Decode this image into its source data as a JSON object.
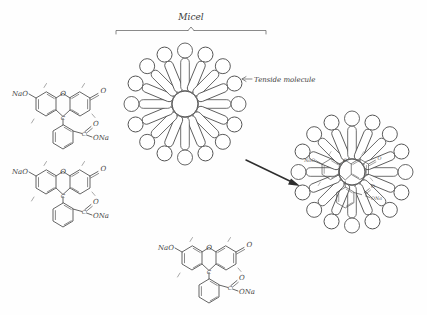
{
  "figure": {
    "kind": "hand-drawn-schematic",
    "background_color": "#fefefe",
    "ink_color": "#4a4a4a",
    "arrow_color": "#2e2e2e",
    "width": 427,
    "height": 315
  },
  "labels": {
    "micelle_title": "Micel",
    "tenside_callout": "Tenside molecule"
  },
  "molecule": {
    "name": "fluorescein disodium",
    "phenolate_label": "NaO",
    "ketone_label": "O",
    "ether_label": "O",
    "bridge_carbon_label": "C",
    "carboxyl_carbon_label": "C",
    "carbonyl_oxygen_label": "O",
    "carboxylate_label": "ONa"
  },
  "molecules_free": [
    {
      "id": "free-molecule-top-left",
      "x": 22,
      "y": 70,
      "scale": 1.0,
      "labels": {
        "NaO": "NaO",
        "O_ether": "O",
        "O_keto": "O",
        "C_bridge": "C",
        "C_acid": "C",
        "O_carbonyl": "O",
        "ONa": "ONa"
      }
    },
    {
      "id": "free-molecule-mid-left",
      "x": 22,
      "y": 148,
      "scale": 1.0,
      "labels": {
        "NaO": "NaO",
        "O_ether": "O",
        "O_keto": "O",
        "C_bridge": "C",
        "C_acid": "C",
        "O_carbonyl": "O",
        "ONa": "ONa"
      }
    },
    {
      "id": "free-molecule-bottom-center",
      "x": 168,
      "y": 224,
      "scale": 1.0,
      "labels": {
        "NaO": "NaO",
        "O_ether": "O",
        "O_keto": "O",
        "C_bridge": "C",
        "C_acid": "C",
        "O_carbonyl": "O",
        "ONa": "ONa"
      }
    }
  ],
  "micelles": [
    {
      "id": "empty-micelle",
      "role": "pure surfactant micelle (left)",
      "center_x": 185,
      "center_y": 104,
      "hub_radius": 13,
      "tail_length": 33,
      "head_radius": 7.5,
      "arm_count": 16,
      "contains_dye": false
    },
    {
      "id": "loaded-micelle",
      "role": "micelle with solubilised dye molecules (right)",
      "center_x": 352,
      "center_y": 172,
      "hub_radius": 13,
      "tail_length": 33,
      "head_radius": 7.5,
      "arm_count": 16,
      "contains_dye": true,
      "embedded_labels": {
        "NaO": "NaO",
        "O_keto": "O",
        "O_ether": "O",
        "ONa": "ONa",
        "O_carbonyl": "O"
      }
    }
  ],
  "bracket": {
    "x_start": 116,
    "x_end": 266,
    "y": 31,
    "tick_x": 191
  },
  "arrow": {
    "x1": 246,
    "y1": 160,
    "x2": 300,
    "y2": 186
  }
}
